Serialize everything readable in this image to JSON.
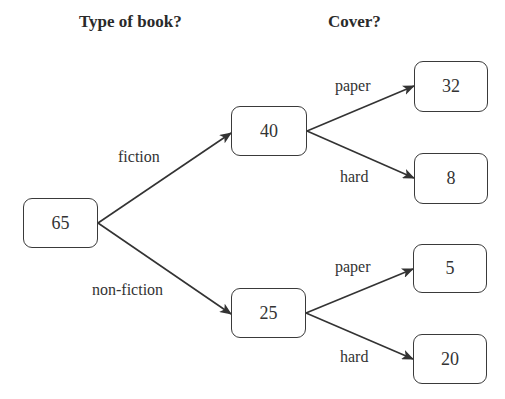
{
  "headings": {
    "level1": "Type of book?",
    "level2": "Cover?"
  },
  "tree": {
    "root": {
      "value": "65"
    },
    "level1": [
      {
        "edge_label": "fiction",
        "value": "40",
        "children": [
          {
            "edge_label": "paper",
            "value": "32"
          },
          {
            "edge_label": "hard",
            "value": "8"
          }
        ]
      },
      {
        "edge_label": "non-fiction",
        "value": "25",
        "children": [
          {
            "edge_label": "paper",
            "value": "5"
          },
          {
            "edge_label": "hard",
            "value": "20"
          }
        ]
      }
    ]
  },
  "colors": {
    "line": "#333333",
    "box_border": "#3a3a3a",
    "text": "#333333",
    "background": "#ffffff"
  }
}
